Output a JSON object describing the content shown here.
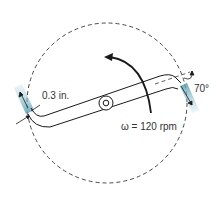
{
  "diagram": {
    "type": "rotating-sprinkler-pipe",
    "labels": {
      "thickness": "0.3 in.",
      "angle": "70°",
      "angular_velocity": "ω = 120 rpm"
    },
    "colors": {
      "line": "#1a1a1a",
      "dashed_circle": "#333333",
      "water_jet": "#7fb8c8",
      "background": "#ffffff"
    }
  }
}
